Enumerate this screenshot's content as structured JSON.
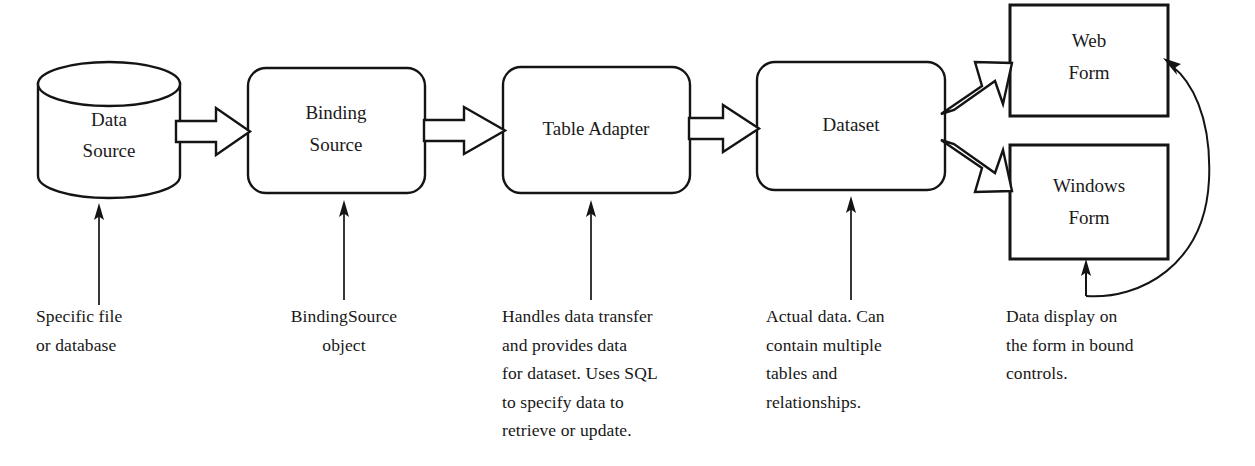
{
  "diagram": {
    "background_color": "#ffffff",
    "line_color": "#141414",
    "nodes": [
      {
        "id": "data-source",
        "label": "Data\nSource",
        "line1": "Data",
        "line2": "Source",
        "shape": "cylinder",
        "x": 38,
        "y": 62,
        "width": 142,
        "height": 136
      },
      {
        "id": "binding-source",
        "label": "Binding\nSource",
        "line1": "Binding",
        "line2": "Source",
        "shape": "rounded-rect",
        "x": 248,
        "y": 68,
        "width": 177,
        "height": 125
      },
      {
        "id": "table-adapter",
        "label": "Table Adapter",
        "line1": "Table Adapter",
        "line2": "",
        "shape": "rounded-rect",
        "x": 503,
        "y": 67,
        "width": 187,
        "height": 126
      },
      {
        "id": "dataset",
        "label": "Dataset",
        "line1": "Dataset",
        "line2": "",
        "shape": "rounded-rect",
        "x": 757,
        "y": 62,
        "width": 188,
        "height": 128
      },
      {
        "id": "web-form",
        "label": "Web\nForm",
        "line1": "Web",
        "line2": "Form",
        "shape": "rect",
        "x": 1010,
        "y": 5,
        "width": 158,
        "height": 111
      },
      {
        "id": "windows-form",
        "label": "Windows\nForm",
        "line1": "Windows",
        "line2": "Form",
        "shape": "rect",
        "x": 1010,
        "y": 145,
        "width": 158,
        "height": 114
      }
    ],
    "flow_arrows": [
      {
        "id": "arrow-data-source-to-binding-source",
        "from": "data-source",
        "to": "binding-source",
        "direction": "right"
      },
      {
        "id": "arrow-binding-source-to-table-adapter",
        "from": "binding-source",
        "to": "table-adapter",
        "direction": "right"
      },
      {
        "id": "arrow-table-adapter-to-dataset",
        "from": "table-adapter",
        "to": "dataset",
        "direction": "right"
      },
      {
        "id": "arrow-dataset-to-web-form",
        "from": "dataset",
        "to": "web-form",
        "direction": "up-right"
      },
      {
        "id": "arrow-dataset-to-windows-form",
        "from": "dataset",
        "to": "windows-form",
        "direction": "down-right"
      },
      {
        "id": "arrow-forms-feedback-to-web-form",
        "from": "windows-form",
        "to": "web-form",
        "direction": "curved-up"
      }
    ],
    "captions": [
      {
        "id": "caption-data-source",
        "target": "data-source",
        "text": "Specific file\nor database",
        "align": "left",
        "x": 36,
        "y": 305,
        "width": 150,
        "leader": {
          "x": 99,
          "from_y": 305,
          "to_y": 203
        }
      },
      {
        "id": "caption-binding-source",
        "target": "binding-source",
        "text": "BindingSource\nobject",
        "align": "center",
        "x": 258,
        "y": 305,
        "width": 165,
        "leader": {
          "x": 344,
          "from_y": 300,
          "to_y": 200
        }
      },
      {
        "id": "caption-table-adapter",
        "target": "table-adapter",
        "text": "Handles data transfer\nand provides data\nfor dataset. Uses SQL\nto specify data to\nretrieve or update.",
        "align": "left",
        "x": 502,
        "y": 305,
        "width": 230,
        "leader": {
          "x": 591,
          "from_y": 300,
          "to_y": 200
        }
      },
      {
        "id": "caption-dataset",
        "target": "dataset",
        "text": "Actual data. Can\ncontain multiple\ntables and\nrelationships.",
        "align": "left",
        "x": 766,
        "y": 305,
        "width": 190,
        "leader": {
          "x": 851,
          "from_y": 300,
          "to_y": 196
        }
      },
      {
        "id": "caption-forms",
        "target": "windows-form",
        "text": "Data display on\nthe form in bound\ncontrols.",
        "align": "left",
        "x": 1006,
        "y": 305,
        "width": 190,
        "leader": {
          "x": 1086,
          "from_y": 296,
          "to_y": 266
        }
      }
    ]
  }
}
